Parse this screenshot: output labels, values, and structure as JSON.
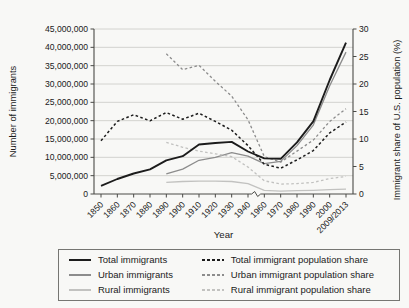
{
  "chart_data": {
    "type": "line",
    "title": "",
    "xlabel": "Year",
    "ylabel_left": "Number of immigrants",
    "ylabel_right": "Immigrant share of U.S. population (%)",
    "grid": "horizontal",
    "legend_position": "bottom-boxed",
    "x_axis_break_between": [
      "1940",
      "1960"
    ],
    "categories": [
      "1850",
      "1860",
      "1870",
      "1880",
      "1890",
      "1900",
      "1910",
      "1920",
      "1930",
      "1940",
      "1960",
      "1970",
      "1980",
      "1990",
      "2000",
      "2009/2013"
    ],
    "y_left_axis": {
      "min": 0,
      "max": 45000000,
      "step": 5000000,
      "tick_labels": [
        "0",
        "5,000,000",
        "10,000,000",
        "15,000,000",
        "20,000,000",
        "25,000,000",
        "30,000,000",
        "35,000,000",
        "40,000,000",
        "45,000,000"
      ]
    },
    "y_right_axis": {
      "min": 0,
      "max": 30,
      "step": 5,
      "tick_labels": [
        "0",
        "5",
        "10",
        "15",
        "20",
        "25",
        "30"
      ]
    },
    "series": [
      {
        "name": "Total immigrants",
        "axis": "left",
        "line_style": "solid",
        "color": "#1c1c1c",
        "values": [
          2200000,
          4100000,
          5600000,
          6700000,
          9200000,
          10300000,
          13500000,
          13900000,
          14200000,
          11600000,
          9700000,
          9600000,
          14100000,
          19800000,
          31100000,
          41300000
        ]
      },
      {
        "name": "Urban immigrants",
        "axis": "left",
        "line_style": "solid",
        "color": "#8c8c8c",
        "values": [
          null,
          null,
          null,
          null,
          5500000,
          6800000,
          9200000,
          10000000,
          11300000,
          10300000,
          8300000,
          8900000,
          13200000,
          18800000,
          29500000,
          38700000
        ]
      },
      {
        "name": "Rural immigrants",
        "axis": "left",
        "line_style": "solid",
        "color": "#c2c2c0",
        "values": [
          null,
          null,
          null,
          null,
          3200000,
          3400000,
          3500000,
          3500000,
          3400000,
          2800000,
          1000000,
          800000,
          900000,
          1000000,
          1200000,
          1300000
        ]
      },
      {
        "name": "Total immigrant population share",
        "axis": "right",
        "line_style": "dashed",
        "color": "#1c1c1c",
        "values": [
          9.7,
          13.2,
          14.4,
          13.3,
          14.8,
          13.6,
          14.7,
          13.2,
          11.6,
          8.8,
          5.4,
          4.7,
          6.2,
          7.9,
          11.1,
          13.1
        ]
      },
      {
        "name": "Urban immigrant population share",
        "axis": "right",
        "line_style": "dashed",
        "color": "#8c8c8c",
        "values": [
          null,
          null,
          null,
          null,
          25.5,
          22.6,
          23.4,
          20.5,
          17.8,
          13.5,
          6.8,
          5.8,
          7.8,
          9.8,
          13.2,
          15.5
        ]
      },
      {
        "name": "Rural immigrant population share",
        "axis": "right",
        "line_style": "dashed",
        "color": "#c2c2c0",
        "values": [
          null,
          null,
          null,
          null,
          9.4,
          8.5,
          7.8,
          7.3,
          6.8,
          4.9,
          2.4,
          1.8,
          1.9,
          2.1,
          2.8,
          3.2
        ]
      }
    ],
    "legend_row_order": [
      0,
      3,
      1,
      4,
      2,
      5
    ]
  },
  "colors": {
    "axis": "#4a4a46",
    "gridline": "#cfcfcb",
    "text": "#1a1a1a",
    "background": "#f8f8f6"
  }
}
